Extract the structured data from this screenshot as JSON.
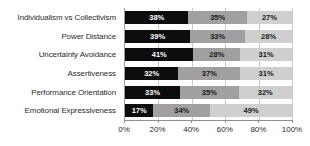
{
  "chart_data": {
    "type": "bar",
    "orientation": "horizontal",
    "stacked": true,
    "normalized_percent": true,
    "title": "",
    "subtitle": "",
    "xlabel": "",
    "ylabel": "",
    "xlim": [
      0,
      100
    ],
    "xticks": [
      0,
      20,
      40,
      60,
      80,
      100
    ],
    "xtick_labels": [
      "0%",
      "20%",
      "40%",
      "60%",
      "80%",
      "100%"
    ],
    "grid": true,
    "grid_axis": "x",
    "legend": false,
    "legend_position": "none",
    "categories": [
      "Individualism vs Collectivism",
      "Power Distance",
      "Uncertainty Avoidance",
      "Assertiveness",
      "Performance Orientation",
      "Emotional Expressiveness"
    ],
    "series": [
      {
        "name": "segment-1",
        "color": "#0d0d0d",
        "values": [
          38,
          39,
          41,
          32,
          33,
          17
        ],
        "labels": [
          "38%",
          "39%",
          "41%",
          "32%",
          "33%",
          "17%"
        ]
      },
      {
        "name": "segment-2",
        "color": "#a0a0a0",
        "values": [
          35,
          33,
          28,
          37,
          35,
          34
        ],
        "labels": [
          "35%",
          "33%",
          "28%",
          "37%",
          "35%",
          "34%"
        ]
      },
      {
        "name": "segment-3",
        "color": "#cfcfcf",
        "values": [
          27,
          28,
          31,
          31,
          32,
          49
        ],
        "labels": [
          "27%",
          "28%",
          "31%",
          "31%",
          "32%",
          "49%"
        ]
      }
    ]
  },
  "colors": {
    "segment_1": "#0d0d0d",
    "segment_2": "#a0a0a0",
    "segment_3": "#cfcfcf",
    "axis": "#8f8f8f",
    "grid": "#c9c9c9",
    "text": "#2b2b2b",
    "background": "#ffffff"
  }
}
